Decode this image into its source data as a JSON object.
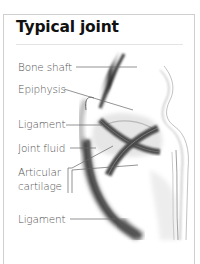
{
  "title": "Typical joint",
  "labels": {
    "bone_shaft": "Bone shaft",
    "epiphysis": "Epiphysis",
    "ligament_upper": "Ligament",
    "joint_fluid": "Joint fluid",
    "articular_line1": "Articular",
    "articular_line2": "cartilage",
    "ligament_lower": "Ligament"
  },
  "colors": {
    "frame": "#cfcfcf",
    "title": "#111111",
    "label_text": "#555555",
    "leader_line": "#666666",
    "ligament": "#555555",
    "cartilage": "#c8c8c8"
  }
}
